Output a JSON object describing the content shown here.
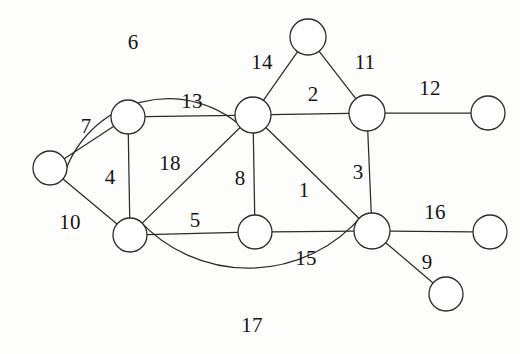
{
  "figure": {
    "type": "undirected-graph-diagram",
    "background_color": "#fdfdfb",
    "stroke_color": "#2b2b2b",
    "label_color": "#141414",
    "node_fill": "#ffffff",
    "width": 520,
    "height": 354
  },
  "nodes": [
    {
      "id": "n1",
      "name": "node-left",
      "x": 50,
      "y": 168,
      "r": 17
    },
    {
      "id": "n2",
      "name": "node-upper-left",
      "x": 128,
      "y": 117,
      "r": 17
    },
    {
      "id": "n3",
      "name": "node-lower-left",
      "x": 130,
      "y": 235,
      "r": 17
    },
    {
      "id": "n4",
      "name": "node-center-hub",
      "x": 253,
      "y": 115,
      "r": 18
    },
    {
      "id": "n5",
      "name": "node-top",
      "x": 308,
      "y": 37,
      "r": 18
    },
    {
      "id": "n6",
      "name": "node-upper-right",
      "x": 367,
      "y": 113,
      "r": 18
    },
    {
      "id": "n7",
      "name": "node-right-top-end",
      "x": 488,
      "y": 113,
      "r": 17
    },
    {
      "id": "n8",
      "name": "node-bottom-center",
      "x": 255,
      "y": 232,
      "r": 17
    },
    {
      "id": "n9",
      "name": "node-lower-right",
      "x": 372,
      "y": 231,
      "r": 18
    },
    {
      "id": "n10",
      "name": "node-right-mid-end",
      "x": 490,
      "y": 232,
      "r": 17
    },
    {
      "id": "n11",
      "name": "node-bottom-end",
      "x": 446,
      "y": 294,
      "r": 17
    }
  ],
  "edges": [
    {
      "id": "e1",
      "label": "1",
      "from": "n4",
      "to": "n9",
      "shape": "line",
      "label_x": 304,
      "label_y": 190
    },
    {
      "id": "e2",
      "label": "2",
      "from": "n4",
      "to": "n6",
      "shape": "line",
      "label_x": 313,
      "label_y": 94
    },
    {
      "id": "e3",
      "label": "3",
      "from": "n6",
      "to": "n9",
      "shape": "line",
      "label_x": 358,
      "label_y": 172
    },
    {
      "id": "e4",
      "label": "4",
      "from": "n2",
      "to": "n3",
      "shape": "line",
      "label_x": 110,
      "label_y": 177
    },
    {
      "id": "e5",
      "label": "5",
      "from": "n3",
      "to": "n8",
      "shape": "line",
      "label_x": 195,
      "label_y": 220
    },
    {
      "id": "e6",
      "label": "6",
      "from": "n1",
      "to": "n4",
      "shape": "arc",
      "sweep": 1,
      "bulge": 78,
      "label_x": 133,
      "label_y": 42
    },
    {
      "id": "e7",
      "label": "7",
      "from": "n1",
      "to": "n2",
      "shape": "line",
      "label_x": 86,
      "label_y": 126
    },
    {
      "id": "e8",
      "label": "8",
      "from": "n4",
      "to": "n8",
      "shape": "line",
      "label_x": 240,
      "label_y": 178
    },
    {
      "id": "e9",
      "label": "9",
      "from": "n9",
      "to": "n11",
      "shape": "line",
      "label_x": 427,
      "label_y": 262
    },
    {
      "id": "e10",
      "label": "10",
      "from": "n1",
      "to": "n3",
      "shape": "line",
      "label_x": 70,
      "label_y": 222
    },
    {
      "id": "e11",
      "label": "11",
      "from": "n5",
      "to": "n6",
      "shape": "line",
      "label_x": 365,
      "label_y": 62
    },
    {
      "id": "e12",
      "label": "12",
      "from": "n6",
      "to": "n7",
      "shape": "line",
      "label_x": 430,
      "label_y": 88
    },
    {
      "id": "e13",
      "label": "13",
      "from": "n2",
      "to": "n4",
      "shape": "line",
      "label_x": 192,
      "label_y": 101
    },
    {
      "id": "e14",
      "label": "14",
      "from": "n4",
      "to": "n5",
      "shape": "line",
      "label_x": 262,
      "label_y": 62
    },
    {
      "id": "e15",
      "label": "15",
      "from": "n8",
      "to": "n9",
      "shape": "line",
      "label_x": 306,
      "label_y": 258
    },
    {
      "id": "e16",
      "label": "16",
      "from": "n9",
      "to": "n10",
      "shape": "line",
      "label_x": 435,
      "label_y": 212
    },
    {
      "id": "e17",
      "label": "17",
      "from": "n3",
      "to": "n9",
      "shape": "arc",
      "sweep": 0,
      "bulge": 62,
      "label_x": 252,
      "label_y": 325
    },
    {
      "id": "e18",
      "label": "18",
      "from": "n3",
      "to": "n4",
      "shape": "line",
      "label_x": 170,
      "label_y": 163
    }
  ]
}
